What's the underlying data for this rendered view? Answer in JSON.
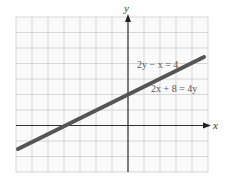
{
  "chart_data": {
    "type": "line",
    "title": "",
    "xlabel": "x",
    "ylabel": "y",
    "xlim": [
      -7,
      5
    ],
    "ylim": [
      -3,
      7
    ],
    "grid": true,
    "tick_labels": false,
    "series": [
      {
        "name": "2y − x = 4",
        "alt_name": "2x + 8 = 4y",
        "equation": "y = x/2 + 2",
        "x": [
          -7.1,
          -4,
          0,
          4.8
        ],
        "y": [
          -1.55,
          0,
          2,
          4.4
        ],
        "color": "#555555"
      }
    ],
    "annotations": [
      {
        "text": "2y − x = 4",
        "x": 1.2,
        "y": 4.4
      },
      {
        "text": "2x + 8 = 4y",
        "x": 2.6,
        "y": 2.5
      }
    ],
    "legend": "none"
  },
  "labels": {
    "eq1": "2y − x = 4",
    "eq2": "2x + 8 = 4y",
    "x_axis": "x",
    "y_axis": "y"
  },
  "colors": {
    "grid": "#d6d6d6",
    "axis": "#333333",
    "line": "#555555",
    "text": "#555555"
  }
}
